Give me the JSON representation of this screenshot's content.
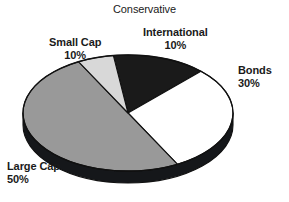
{
  "chart_data": {
    "type": "pie",
    "title": "Conservative",
    "subtitle": "",
    "xlabel": "",
    "ylabel": "",
    "grid": false,
    "legend_position": "none",
    "labels_inline": true,
    "three_d": true,
    "total": 100,
    "units": "%",
    "categories": [
      "International",
      "Bonds",
      "Large Cap",
      "Small Cap"
    ],
    "values": [
      10,
      30,
      50,
      10
    ],
    "slices": [
      {
        "name": "International",
        "label": "International",
        "value": 10,
        "value_text": "10%",
        "color": "#1a1a1a",
        "start_angle": -8,
        "end_angle": 44,
        "label_position": "top-right"
      },
      {
        "name": "Bonds",
        "label": "Bonds",
        "value": 30,
        "value_text": "30%",
        "color": "#ffffff",
        "start_angle": 44,
        "end_angle": 152,
        "label_position": "right"
      },
      {
        "name": "Large Cap",
        "label": "Large Cap",
        "value": 50,
        "value_text": "50%",
        "color": "#999999",
        "start_angle": 152,
        "end_angle": 332,
        "label_position": "bottom-left"
      },
      {
        "name": "Small Cap",
        "label": "Small Cap",
        "value": 10,
        "value_text": "10%",
        "color": "#d8d8d8",
        "start_angle": 332,
        "end_angle": 352,
        "label_position": "top-left"
      }
    ],
    "geometry": {
      "center_x": 128,
      "center_y": 113,
      "radius_x": 105,
      "radius_y": 58,
      "depth": 12
    },
    "colors": {
      "international": "#1a1a1a",
      "bonds": "#ffffff",
      "large_cap": "#999999",
      "small_cap": "#d8d8d8",
      "outline": "#111111",
      "background": "#ffffff",
      "text": "#1a1a1a"
    }
  }
}
